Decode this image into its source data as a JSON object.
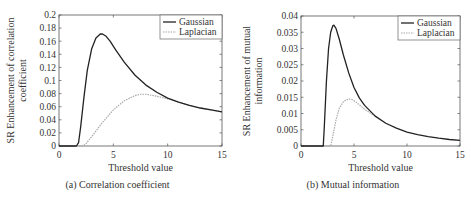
{
  "chart_data": [
    {
      "type": "line",
      "panel": "a",
      "caption": "(a) Correlation coefficient",
      "title": "",
      "xlabel": "Threshold value",
      "ylabel_line1": "SR Enhancement of correlation",
      "ylabel_line2": "coefficient",
      "xlim": [
        0,
        15
      ],
      "ylim": [
        0,
        0.2
      ],
      "xticks": [
        0,
        5,
        10,
        15
      ],
      "xtick_labels": [
        "0",
        "5",
        "10",
        "15"
      ],
      "yticks": [
        0,
        0.02,
        0.04,
        0.06,
        0.08,
        0.1,
        0.12,
        0.14,
        0.16,
        0.18,
        0.2
      ],
      "ytick_labels": [
        "0",
        "0.02",
        "0.04",
        "0.06",
        "0.08",
        "0.1",
        "0.12",
        "0.14",
        "0.16",
        "0.18",
        "0.2"
      ],
      "grid": false,
      "legend_position": "upper right",
      "series": [
        {
          "name": "Gaussian",
          "color": "#222222",
          "style": "solid",
          "x": [
            0,
            1.6,
            1.8,
            2.0,
            2.3,
            2.6,
            3.0,
            3.4,
            3.8,
            4.0,
            4.3,
            4.7,
            5.2,
            6.0,
            7.0,
            8.0,
            9.0,
            10.0,
            11.0,
            12.0,
            13.0,
            14.0,
            15.0
          ],
          "y": [
            0,
            0,
            0.005,
            0.03,
            0.075,
            0.115,
            0.148,
            0.165,
            0.171,
            0.171,
            0.168,
            0.16,
            0.147,
            0.128,
            0.108,
            0.093,
            0.082,
            0.073,
            0.067,
            0.062,
            0.058,
            0.055,
            0.052
          ]
        },
        {
          "name": "Laplacian",
          "color": "#aaaaaa",
          "style": "dotted",
          "x": [
            0,
            2.2,
            2.5,
            3.0,
            3.5,
            4.0,
            5.0,
            6.0,
            7.0,
            7.5,
            8.0,
            9.0,
            10.0,
            11.0,
            12.0,
            13.0,
            14.0,
            15.0
          ],
          "y": [
            0,
            0,
            0.004,
            0.014,
            0.025,
            0.036,
            0.055,
            0.069,
            0.077,
            0.079,
            0.079,
            0.076,
            0.072,
            0.067,
            0.062,
            0.058,
            0.055,
            0.052
          ]
        }
      ]
    },
    {
      "type": "line",
      "panel": "b",
      "caption": "(b) Mutual information",
      "title": "",
      "xlabel": "Threshold value",
      "ylabel_line1": "SR Enhancement of mutual",
      "ylabel_line2": "information",
      "xlim": [
        0,
        15
      ],
      "ylim": [
        0,
        0.04
      ],
      "xticks": [
        0,
        5,
        10,
        15
      ],
      "xtick_labels": [
        "0",
        "5",
        "10",
        "15"
      ],
      "yticks": [
        0,
        0.005,
        0.01,
        0.015,
        0.02,
        0.025,
        0.03,
        0.035,
        0.04
      ],
      "ytick_labels": [
        "0",
        "0.005",
        "0.01",
        "0.015",
        "0.02",
        "0.025",
        "0.03",
        "0.035",
        "0.04"
      ],
      "grid": false,
      "legend_position": "upper right",
      "series": [
        {
          "name": "Gaussian",
          "color": "#222222",
          "style": "solid",
          "x": [
            0,
            2.1,
            2.2,
            2.4,
            2.6,
            2.8,
            3.0,
            3.1,
            3.3,
            3.6,
            4.0,
            4.5,
            5.0,
            5.5,
            6.0,
            7.0,
            8.0,
            9.0,
            10.0,
            11.0,
            12.0,
            13.0,
            14.0,
            15.0
          ],
          "y": [
            0,
            0,
            0.006,
            0.02,
            0.03,
            0.035,
            0.037,
            0.0372,
            0.0362,
            0.033,
            0.028,
            0.0225,
            0.018,
            0.0148,
            0.0125,
            0.0092,
            0.007,
            0.0055,
            0.0043,
            0.0035,
            0.0029,
            0.0024,
            0.002,
            0.0017
          ]
        },
        {
          "name": "Laplacian",
          "color": "#aaaaaa",
          "style": "dotted",
          "x": [
            0,
            2.8,
            3.0,
            3.3,
            3.6,
            4.0,
            4.5,
            4.8,
            5.2,
            5.6,
            6.0,
            6.5,
            7.0
          ],
          "y": [
            0,
            0,
            0.003,
            0.008,
            0.0115,
            0.0137,
            0.0145,
            0.0143,
            0.0135,
            0.0124,
            0.0113,
            0.0102,
            0.0092
          ]
        }
      ]
    }
  ]
}
